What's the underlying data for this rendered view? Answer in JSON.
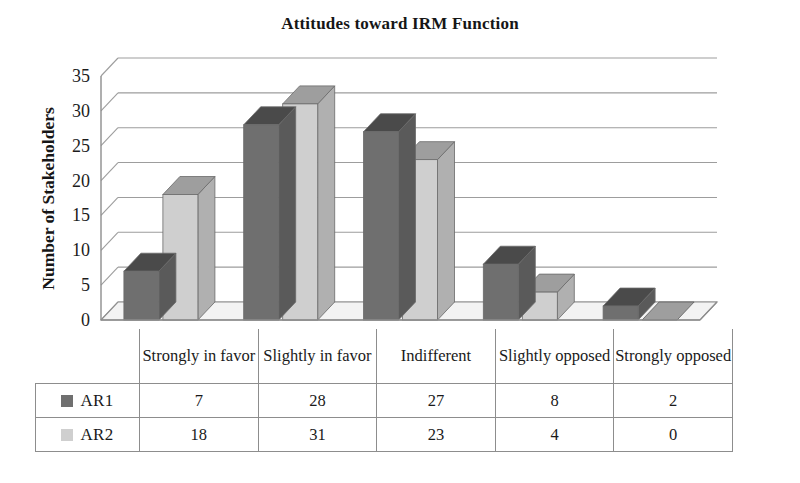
{
  "chart_data": {
    "type": "bar",
    "title": "Attitudes toward IRM Function",
    "xlabel": "",
    "ylabel": "Number of Stakeholders",
    "ylim": [
      0,
      35
    ],
    "ytick_step": 5,
    "yticks": [
      "0",
      "5",
      "10",
      "15",
      "20",
      "25",
      "30",
      "35"
    ],
    "grid": true,
    "legend_position": "table-left",
    "three_d": true,
    "categories": [
      "Strongly in favor",
      "Slightly in favor",
      "Indifferent",
      "Slightly opposed",
      "Strongly opposed"
    ],
    "series": [
      {
        "name": "AR1",
        "color": "#6f6f6f",
        "values": [
          7,
          28,
          27,
          8,
          2
        ]
      },
      {
        "name": "AR2",
        "color": "#cfcfcf",
        "values": [
          18,
          31,
          23,
          4,
          0
        ]
      }
    ]
  },
  "table": {
    "rows": [
      {
        "label": "AR1",
        "cells": [
          "7",
          "28",
          "27",
          "8",
          "2"
        ]
      },
      {
        "label": "AR2",
        "cells": [
          "18",
          "31",
          "23",
          "4",
          "0"
        ]
      }
    ]
  },
  "colors": {
    "series_ar1_front": "#6f6f6f",
    "series_ar1_top": "#4a4a4a",
    "series_ar1_side": "#5a5a5a",
    "series_ar2_front": "#cfcfcf",
    "series_ar2_top": "#9e9e9e",
    "series_ar2_side": "#b0b0b0",
    "axis": "#8d8d8d",
    "grid": "#8d8d8d",
    "text": "#1a1a1a",
    "background": "#ffffff"
  }
}
